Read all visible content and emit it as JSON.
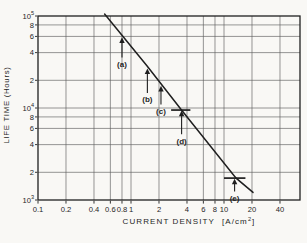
{
  "figure": {
    "background": "#f9f8f5",
    "ink": "#1f1f1f",
    "grid_color": "#5f5f5f"
  },
  "chart_data": {
    "type": "line",
    "title": "",
    "xlabel": "CURRENT DENSITY",
    "xunit_pre": "[A/cm",
    "xunit_sup": "2",
    "xunit_post": "]",
    "ylabel": "LIFE TIME (Hours)",
    "x_scale": "log",
    "y_scale": "log",
    "xlim": [
      0.1,
      65
    ],
    "ylim": [
      1000,
      100000
    ],
    "grid": "at_labeled_ticks",
    "legend": "none",
    "x_ticks": [
      {
        "v": 0.1,
        "label": "0.1"
      },
      {
        "v": 0.2,
        "label": "0.2"
      },
      {
        "v": 0.4,
        "label": "0.4"
      },
      {
        "v": 0.6,
        "label": "0.6"
      },
      {
        "v": 0.8,
        "label": "0.8"
      },
      {
        "v": 1,
        "label": "1"
      },
      {
        "v": 2,
        "label": "2"
      },
      {
        "v": 4,
        "label": "4"
      },
      {
        "v": 6,
        "label": "6"
      },
      {
        "v": 8,
        "label": "8"
      },
      {
        "v": 10,
        "label": "10"
      },
      {
        "v": 20,
        "label": "20"
      },
      {
        "v": 40,
        "label": "40"
      }
    ],
    "y_ticks": [
      {
        "v": 100000,
        "label": "10",
        "exp": "5"
      },
      {
        "v": 80000,
        "label": "8"
      },
      {
        "v": 60000,
        "label": "6"
      },
      {
        "v": 40000,
        "label": "4"
      },
      {
        "v": 20000,
        "label": "2"
      },
      {
        "v": 10000,
        "label": "10",
        "exp": "4"
      },
      {
        "v": 8000,
        "label": "8"
      },
      {
        "v": 6000,
        "label": "6"
      },
      {
        "v": 4000,
        "label": "4"
      },
      {
        "v": 2000,
        "label": "2"
      },
      {
        "v": 1000,
        "label": "10",
        "exp": "3"
      }
    ],
    "series": [
      {
        "name": "life-time-vs-current-density-line",
        "points": [
          [
            0.52,
            105000
          ],
          [
            1.49,
            28600
          ],
          [
            3.49,
            9500
          ],
          [
            13.5,
            1730
          ],
          [
            20.5,
            1210
          ]
        ]
      }
    ],
    "annotations": [
      {
        "id": "a",
        "label": "(a)",
        "x": 0.8,
        "label_y": 30000,
        "style": "arrow-to-line"
      },
      {
        "id": "b",
        "label": "(b)",
        "x": 1.5,
        "label_y": 12400,
        "style": "arrow-to-line"
      },
      {
        "id": "c",
        "label": "(c)",
        "x": 2.1,
        "label_y": 9300,
        "style": "arrow-to-line"
      },
      {
        "id": "d",
        "label": "(d)",
        "x": 3.5,
        "label_y": 4400,
        "style": "arrow-to-bar",
        "bar": {
          "x1": 2.7,
          "x2": 4.35,
          "y": 9500
        }
      },
      {
        "id": "e",
        "label": "(e)",
        "x": 13.0,
        "label_y": 1050,
        "style": "arrow-to-bar",
        "bar": {
          "x1": 10.0,
          "x2": 17.0,
          "y": 1730
        }
      }
    ]
  }
}
